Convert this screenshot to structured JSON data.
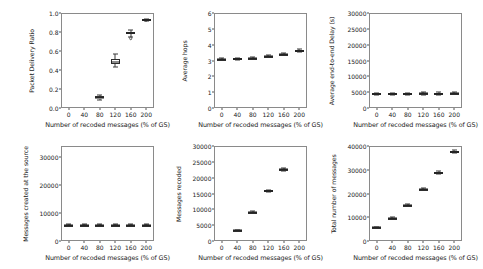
{
  "figure": {
    "background": "#ffffff",
    "line_color": "#333333",
    "rows": 2,
    "cols": 3,
    "shared_xlabel": "Number of recoded messages (% of GS)"
  },
  "chart_data": [
    {
      "type": "box",
      "id": "packet-delivery-ratio",
      "title": "",
      "xlabel": "Number of recoded messages (% of GS)",
      "ylabel": "Packet Delivery Ratio",
      "xticks": [
        0,
        40,
        80,
        120,
        160,
        200
      ],
      "xticklabels": [
        "0",
        "40",
        "80",
        "120",
        "160",
        "200"
      ],
      "yticks": [
        0.0,
        0.2,
        0.4,
        0.6,
        0.8,
        1.0
      ],
      "yticklabels": [
        "0.0",
        "0.2",
        "0.4",
        "0.6",
        "0.8",
        "1.0"
      ],
      "xlim": [
        -20,
        220
      ],
      "ylim": [
        0.0,
        1.0
      ],
      "grid": false,
      "boxes": [
        {
          "x": 80,
          "whisker_low": 0.085,
          "q1": 0.1,
          "median": 0.11,
          "q3": 0.122,
          "whisker_high": 0.138,
          "fliers": []
        },
        {
          "x": 120,
          "whisker_low": 0.43,
          "q1": 0.468,
          "median": 0.487,
          "q3": 0.512,
          "whisker_high": 0.565,
          "fliers": []
        },
        {
          "x": 160,
          "whisker_low": 0.745,
          "q1": 0.782,
          "median": 0.793,
          "q3": 0.805,
          "whisker_high": 0.822,
          "fliers": [
            0.735
          ]
        },
        {
          "x": 200,
          "whisker_low": 0.912,
          "q1": 0.921,
          "median": 0.927,
          "q3": 0.932,
          "whisker_high": 0.94,
          "fliers": []
        }
      ]
    },
    {
      "type": "box",
      "id": "average-hops",
      "title": "",
      "xlabel": "Number of recoded messages (% of GS)",
      "ylabel": "Average hops",
      "xticks": [
        0,
        40,
        80,
        120,
        160,
        200
      ],
      "xticklabels": [
        "0",
        "40",
        "80",
        "120",
        "160",
        "200"
      ],
      "yticks": [
        0,
        1,
        2,
        3,
        4,
        5,
        6
      ],
      "yticklabels": [
        "0",
        "1",
        "2",
        "3",
        "4",
        "5",
        "6"
      ],
      "xlim": [
        -20,
        220
      ],
      "ylim": [
        0,
        6
      ],
      "grid": false,
      "boxes": [
        {
          "x": 0,
          "whisker_low": 3.04,
          "q1": 3.08,
          "median": 3.1,
          "q3": 3.12,
          "whisker_high": 3.16,
          "fliers": []
        },
        {
          "x": 40,
          "whisker_low": 3.05,
          "q1": 3.09,
          "median": 3.11,
          "q3": 3.13,
          "whisker_high": 3.17,
          "fliers": []
        },
        {
          "x": 80,
          "whisker_low": 3.07,
          "q1": 3.11,
          "median": 3.14,
          "q3": 3.16,
          "whisker_high": 3.2,
          "fliers": []
        },
        {
          "x": 120,
          "whisker_low": 3.2,
          "q1": 3.25,
          "median": 3.27,
          "q3": 3.3,
          "whisker_high": 3.34,
          "fliers": []
        },
        {
          "x": 160,
          "whisker_low": 3.32,
          "q1": 3.37,
          "median": 3.4,
          "q3": 3.43,
          "whisker_high": 3.48,
          "fliers": []
        },
        {
          "x": 200,
          "whisker_low": 3.55,
          "q1": 3.6,
          "median": 3.63,
          "q3": 3.66,
          "whisker_high": 3.7,
          "fliers": []
        }
      ]
    },
    {
      "type": "box",
      "id": "average-end-to-end-delay",
      "title": "",
      "xlabel": "Number of recoded messages (% of GS)",
      "ylabel": "Average end-to-end Delay (s)",
      "xticks": [
        0,
        40,
        80,
        120,
        160,
        200
      ],
      "xticklabels": [
        "0",
        "40",
        "80",
        "120",
        "160",
        "200"
      ],
      "yticks": [
        0,
        5000,
        10000,
        15000,
        20000,
        25000,
        30000
      ],
      "yticklabels": [
        "0",
        "5000",
        "10000",
        "15000",
        "20000",
        "25000",
        "30000"
      ],
      "xlim": [
        -20,
        220
      ],
      "ylim": [
        0,
        30000
      ],
      "grid": false,
      "boxes": [
        {
          "x": 0,
          "whisker_low": 4150,
          "q1": 4380,
          "median": 4480,
          "q3": 4580,
          "whisker_high": 4800,
          "fliers": []
        },
        {
          "x": 40,
          "whisker_low": 4180,
          "q1": 4400,
          "median": 4500,
          "q3": 4600,
          "whisker_high": 4820,
          "fliers": []
        },
        {
          "x": 80,
          "whisker_low": 4200,
          "q1": 4430,
          "median": 4540,
          "q3": 4640,
          "whisker_high": 4870,
          "fliers": []
        },
        {
          "x": 120,
          "whisker_low": 4250,
          "q1": 4480,
          "median": 4600,
          "q3": 4700,
          "whisker_high": 4930,
          "fliers": []
        },
        {
          "x": 160,
          "whisker_low": 4220,
          "q1": 4450,
          "median": 4560,
          "q3": 4670,
          "whisker_high": 4900,
          "fliers": []
        },
        {
          "x": 200,
          "whisker_low": 4300,
          "q1": 4540,
          "median": 4660,
          "q3": 4780,
          "whisker_high": 5020,
          "fliers": []
        }
      ]
    },
    {
      "type": "box",
      "id": "messages-created-at-the-source",
      "title": "",
      "xlabel": "Number of recoded messages (% of GS)",
      "ylabel": "Messages created at the source",
      "xticks": [
        0,
        40,
        80,
        120,
        160,
        200
      ],
      "xticklabels": [
        "0",
        "40",
        "80",
        "120",
        "160",
        "200"
      ],
      "yticks": [
        0,
        10000,
        20000,
        30000
      ],
      "yticklabels": [
        "0",
        "10000",
        "20000",
        "30000"
      ],
      "xlim": [
        -20,
        220
      ],
      "ylim": [
        0,
        34000
      ],
      "grid": false,
      "boxes": [
        {
          "x": 0,
          "whisker_low": 5600,
          "q1": 5720,
          "median": 5800,
          "q3": 5880,
          "whisker_high": 6000,
          "fliers": []
        },
        {
          "x": 40,
          "whisker_low": 5600,
          "q1": 5720,
          "median": 5800,
          "q3": 5880,
          "whisker_high": 6000,
          "fliers": []
        },
        {
          "x": 80,
          "whisker_low": 5600,
          "q1": 5720,
          "median": 5810,
          "q3": 5890,
          "whisker_high": 6010,
          "fliers": []
        },
        {
          "x": 120,
          "whisker_low": 5610,
          "q1": 5730,
          "median": 5815,
          "q3": 5895,
          "whisker_high": 6020,
          "fliers": []
        },
        {
          "x": 160,
          "whisker_low": 5610,
          "q1": 5730,
          "median": 5815,
          "q3": 5895,
          "whisker_high": 6020,
          "fliers": []
        },
        {
          "x": 200,
          "whisker_low": 5620,
          "q1": 5740,
          "median": 5825,
          "q3": 5905,
          "whisker_high": 6030,
          "fliers": []
        }
      ]
    },
    {
      "type": "box",
      "id": "messages-recoded",
      "title": "",
      "xlabel": "Number of recoded messages (% of GS)",
      "ylabel": "Messages recoded",
      "xticks": [
        0,
        40,
        80,
        120,
        160,
        200
      ],
      "xticklabels": [
        "0",
        "40",
        "80",
        "120",
        "160",
        "200"
      ],
      "yticks": [
        0,
        5000,
        10000,
        15000,
        20000,
        25000,
        30000
      ],
      "yticklabels": [
        "0",
        "5000",
        "10000",
        "15000",
        "20000",
        "25000",
        "30000"
      ],
      "xlim": [
        -20,
        220
      ],
      "ylim": [
        0,
        30000
      ],
      "grid": false,
      "boxes": [
        {
          "x": 40,
          "whisker_low": 3150,
          "q1": 3280,
          "median": 3350,
          "q3": 3420,
          "whisker_high": 3560,
          "fliers": []
        },
        {
          "x": 80,
          "whisker_low": 8700,
          "q1": 8950,
          "median": 9080,
          "q3": 9220,
          "whisker_high": 9480,
          "fliers": []
        },
        {
          "x": 120,
          "whisker_low": 15400,
          "q1": 15680,
          "median": 15820,
          "q3": 15960,
          "whisker_high": 16250,
          "fliers": []
        },
        {
          "x": 160,
          "whisker_low": 22100,
          "q1": 22450,
          "median": 22650,
          "q3": 22850,
          "whisker_high": 23200,
          "fliers": []
        }
      ]
    },
    {
      "type": "box",
      "id": "total-number-of-messages",
      "title": "",
      "xlabel": "Number of recoded messages (% of GS)",
      "ylabel": "Total number of messages",
      "xticks": [
        0,
        40,
        80,
        120,
        160,
        200
      ],
      "xticklabels": [
        "0",
        "40",
        "80",
        "120",
        "160",
        "200"
      ],
      "yticks": [
        0,
        10000,
        20000,
        30000,
        40000
      ],
      "yticklabels": [
        "0",
        "10000",
        "20000",
        "30000",
        "40000"
      ],
      "xlim": [
        -20,
        220
      ],
      "ylim": [
        0,
        40000
      ],
      "grid": false,
      "boxes": [
        {
          "x": 0,
          "whisker_low": 5550,
          "q1": 5700,
          "median": 5800,
          "q3": 5900,
          "whisker_high": 6050,
          "fliers": []
        },
        {
          "x": 40,
          "whisker_low": 9200,
          "q1": 9450,
          "median": 9580,
          "q3": 9710,
          "whisker_high": 9950,
          "fliers": []
        },
        {
          "x": 80,
          "whisker_low": 14550,
          "q1": 14900,
          "median": 15080,
          "q3": 15260,
          "whisker_high": 15600,
          "fliers": []
        },
        {
          "x": 120,
          "whisker_low": 21300,
          "q1": 21700,
          "median": 21900,
          "q3": 22100,
          "whisker_high": 22500,
          "fliers": []
        },
        {
          "x": 160,
          "whisker_low": 28100,
          "q1": 28550,
          "median": 28800,
          "q3": 29050,
          "whisker_high": 29500,
          "fliers": []
        },
        {
          "x": 200,
          "whisker_low": 36900,
          "q1": 37350,
          "median": 37600,
          "q3": 37850,
          "whisker_high": 38300,
          "fliers": []
        }
      ]
    }
  ]
}
